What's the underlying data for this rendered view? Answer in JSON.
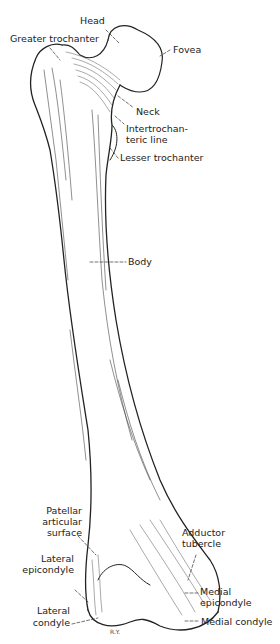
{
  "figure": {
    "labels": {
      "head": "Head",
      "greater_trochanter": "Greater trochanter",
      "fovea": "Fovea",
      "neck": "Neck",
      "intertrochanteric_line_1": "Intertrochan-",
      "intertrochanteric_line_2": "teric line",
      "lesser_trochanter": "Lesser trochanter",
      "body": "Body",
      "patellar_surface_1": "Patellar",
      "patellar_surface_2": "articular",
      "patellar_surface_3": "surface",
      "adductor_tubercle_1": "Adductor",
      "adductor_tubercle_2": "tubercle",
      "lateral_epicondyle_1": "Lateral",
      "lateral_epicondyle_2": "epicondyle",
      "medial_epicondyle_1": "Medial",
      "medial_epicondyle_2": "epicondyle",
      "lateral_condyle_1": "Lateral",
      "lateral_condyle_2": "condyle",
      "medial_condyle": "Medial condyle"
    },
    "artist_signature": "R.Y.",
    "colors": {
      "ink": "#222222",
      "background": "#ffffff"
    }
  }
}
